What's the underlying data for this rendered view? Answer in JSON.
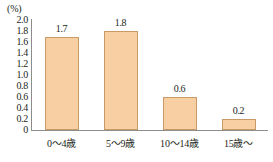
{
  "chart_data": {
    "type": "bar",
    "title": "",
    "subtitle": "",
    "xlabel": "",
    "ylabel": "",
    "unit_label": "(%)",
    "categories": [
      "0〜4歳",
      "5〜9歳",
      "10〜14歳",
      "15歳〜"
    ],
    "values": [
      1.7,
      1.8,
      0.6,
      0.2
    ],
    "value_labels": [
      "1.7",
      "1.8",
      "0.6",
      "0.2"
    ],
    "ylim": [
      0,
      2.0
    ],
    "ytick_step": 0.2,
    "ytick_labels": [
      "2.0",
      "1.8",
      "1.6",
      "1.4",
      "1.2",
      "1.0",
      "0.8",
      "0.6",
      "0.4",
      "0.2",
      "0"
    ],
    "ytick_values": [
      2.0,
      1.8,
      1.6,
      1.4,
      1.2,
      1.0,
      0.8,
      0.6,
      0.4,
      0.2,
      0
    ],
    "grid": false,
    "legend": null,
    "legend_position": "none",
    "annotations": [],
    "colors": {
      "bar_fill": "#f7cfa2",
      "bar_border": "#c79a67",
      "axis": "#8c8c8c",
      "text": "#231f20",
      "background": "#ffffff"
    }
  }
}
